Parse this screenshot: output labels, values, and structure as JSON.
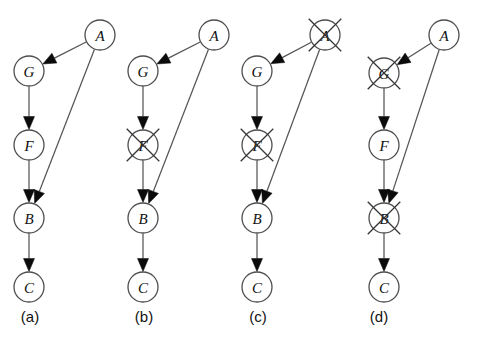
{
  "figure": {
    "background_color": "#ffffff",
    "node_stroke_color": "#4d4d4d",
    "edge_color": "#55555a",
    "arrow_color": "#0b0b0b",
    "cross_color": "#333333",
    "node_radius": 15,
    "cross_half_length": 23
  },
  "panels": [
    {
      "id": "panel-a",
      "label": "(a)",
      "label_x": 30,
      "label_y": 322,
      "nodes": [
        {
          "id": "A",
          "label": "A",
          "x": 100,
          "y": 35,
          "crossed": false
        },
        {
          "id": "G",
          "label": "G",
          "x": 29,
          "y": 71,
          "crossed": false
        },
        {
          "id": "F",
          "label": "F",
          "x": 29,
          "y": 145,
          "crossed": false
        },
        {
          "id": "B",
          "label": "B",
          "x": 29,
          "y": 218,
          "crossed": false
        },
        {
          "id": "C",
          "label": "C",
          "x": 29,
          "y": 287,
          "crossed": false
        }
      ],
      "edges": [
        {
          "from": "A",
          "to": "G"
        },
        {
          "from": "A",
          "to": "B"
        },
        {
          "from": "G",
          "to": "F"
        },
        {
          "from": "F",
          "to": "B"
        },
        {
          "from": "B",
          "to": "C"
        }
      ]
    },
    {
      "id": "panel-b",
      "label": "(b)",
      "label_x": 144,
      "label_y": 322,
      "nodes": [
        {
          "id": "A",
          "label": "A",
          "x": 214,
          "y": 35,
          "crossed": false
        },
        {
          "id": "G",
          "label": "G",
          "x": 143,
          "y": 71,
          "crossed": false
        },
        {
          "id": "F",
          "label": "F",
          "x": 143,
          "y": 145,
          "crossed": true
        },
        {
          "id": "B",
          "label": "B",
          "x": 143,
          "y": 218,
          "crossed": false
        },
        {
          "id": "C",
          "label": "C",
          "x": 143,
          "y": 287,
          "crossed": false
        }
      ],
      "edges": [
        {
          "from": "A",
          "to": "G"
        },
        {
          "from": "A",
          "to": "B"
        },
        {
          "from": "G",
          "to": "F"
        },
        {
          "from": "F",
          "to": "B"
        },
        {
          "from": "B",
          "to": "C"
        }
      ]
    },
    {
      "id": "panel-c",
      "label": "(c)",
      "label_x": 258,
      "label_y": 322,
      "nodes": [
        {
          "id": "A",
          "label": "A",
          "x": 325,
          "y": 35,
          "crossed": true
        },
        {
          "id": "G",
          "label": "G",
          "x": 257,
          "y": 71,
          "crossed": false
        },
        {
          "id": "F",
          "label": "F",
          "x": 257,
          "y": 145,
          "crossed": true
        },
        {
          "id": "B",
          "label": "B",
          "x": 257,
          "y": 218,
          "crossed": false
        },
        {
          "id": "C",
          "label": "C",
          "x": 257,
          "y": 287,
          "crossed": false
        }
      ],
      "edges": [
        {
          "from": "A",
          "to": "G"
        },
        {
          "from": "A",
          "to": "B"
        },
        {
          "from": "G",
          "to": "F"
        },
        {
          "from": "F",
          "to": "B"
        },
        {
          "from": "B",
          "to": "C"
        }
      ]
    },
    {
      "id": "panel-d",
      "label": "(d)",
      "label_x": 379,
      "label_y": 322,
      "nodes": [
        {
          "id": "A",
          "label": "A",
          "x": 444,
          "y": 35,
          "crossed": false
        },
        {
          "id": "G",
          "label": "G",
          "x": 384,
          "y": 73,
          "crossed": true
        },
        {
          "id": "F",
          "label": "F",
          "x": 384,
          "y": 145,
          "crossed": false
        },
        {
          "id": "B",
          "label": "B",
          "x": 384,
          "y": 218,
          "crossed": true
        },
        {
          "id": "C",
          "label": "C",
          "x": 384,
          "y": 287,
          "crossed": false
        }
      ],
      "edges": [
        {
          "from": "A",
          "to": "G"
        },
        {
          "from": "A",
          "to": "B"
        },
        {
          "from": "G",
          "to": "F"
        },
        {
          "from": "F",
          "to": "B"
        },
        {
          "from": "B",
          "to": "C"
        }
      ]
    }
  ]
}
